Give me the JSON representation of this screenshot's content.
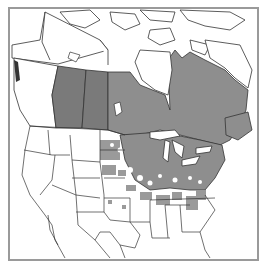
{
  "map": {
    "type": "species-range-map",
    "region": "North America",
    "colors": {
      "background": "#ffffff",
      "frame": "#9a9a9a",
      "outline": "#333333",
      "range_dark": "#7a7a7a",
      "range_medium": "#8e8e8e",
      "range_scattered": "#9a9a9a",
      "water": "#ffffff"
    },
    "shaded_regions": [
      {
        "name": "Alberta",
        "tone": "dark"
      },
      {
        "name": "Saskatchewan",
        "tone": "dark"
      },
      {
        "name": "Manitoba",
        "tone": "medium"
      },
      {
        "name": "Ontario",
        "tone": "medium"
      },
      {
        "name": "Quebec",
        "tone": "medium"
      },
      {
        "name": "Atlantic Canada",
        "tone": "medium"
      },
      {
        "name": "Great Lakes / Northeast US",
        "tone": "medium"
      },
      {
        "name": "Midwest / Appalachians",
        "tone": "scattered"
      }
    ]
  }
}
